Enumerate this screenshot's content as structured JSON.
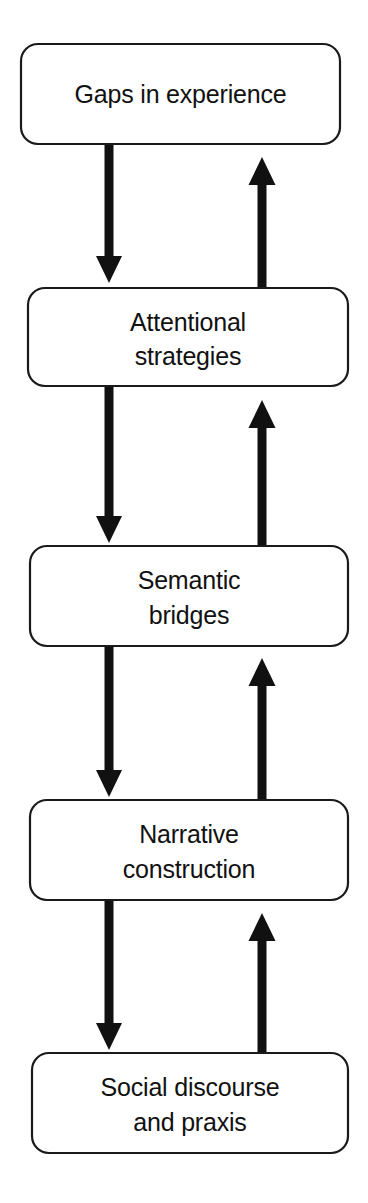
{
  "diagram": {
    "type": "cycle-flow",
    "background_color": "#ffffff",
    "stroke_color": "#1a1a1a",
    "text_color": "#111111",
    "arrow_color": "#111111",
    "nodes": [
      {
        "id": "gaps-in-experience",
        "lines": [
          "Gaps in experience"
        ],
        "line1": "Gaps in experience",
        "line2": ""
      },
      {
        "id": "attentional-strategies",
        "lines": [
          "Attentional",
          "strategies"
        ],
        "line1": "Attentional",
        "line2": "strategies"
      },
      {
        "id": "semantic-bridges",
        "lines": [
          "Semantic",
          "bridges"
        ],
        "line1": "Semantic",
        "line2": "bridges"
      },
      {
        "id": "narrative-construction",
        "lines": [
          "Narrative",
          "construction"
        ],
        "line1": "Narrative",
        "line2": "construction"
      },
      {
        "id": "social-discourse-and-praxis",
        "lines": [
          "Social discourse",
          "and praxis"
        ],
        "line1": "Social discourse",
        "line2": "and praxis"
      }
    ],
    "edges": [
      {
        "id": "down-1",
        "from": "gaps-in-experience",
        "to": "attentional-strategies",
        "direction": "down"
      },
      {
        "id": "down-2",
        "from": "attentional-strategies",
        "to": "semantic-bridges",
        "direction": "down"
      },
      {
        "id": "down-3",
        "from": "semantic-bridges",
        "to": "narrative-construction",
        "direction": "down"
      },
      {
        "id": "down-4",
        "from": "narrative-construction",
        "to": "social-discourse-and-praxis",
        "direction": "down"
      },
      {
        "id": "up-1",
        "from": "attentional-strategies",
        "to": "gaps-in-experience",
        "direction": "up"
      },
      {
        "id": "up-2",
        "from": "semantic-bridges",
        "to": "attentional-strategies",
        "direction": "up"
      },
      {
        "id": "up-3",
        "from": "narrative-construction",
        "to": "semantic-bridges",
        "direction": "up"
      },
      {
        "id": "up-4",
        "from": "social-discourse-and-praxis",
        "to": "narrative-construction",
        "direction": "up"
      }
    ]
  }
}
